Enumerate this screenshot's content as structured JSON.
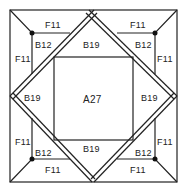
{
  "diagram": {
    "type": "quilt-block-pattern",
    "center_piece": {
      "label": "A27"
    },
    "side_pieces": [
      {
        "position": "top",
        "label": "B19"
      },
      {
        "position": "left",
        "label": "B19"
      },
      {
        "position": "right",
        "label": "B19"
      },
      {
        "position": "bottom",
        "label": "B19"
      }
    ],
    "corners": [
      {
        "position": "top-left",
        "small_square": "B12",
        "triangle_a": "F11",
        "triangle_b": "F11"
      },
      {
        "position": "top-right",
        "small_square": "B12",
        "triangle_a": "F11",
        "triangle_b": "F11"
      },
      {
        "position": "bottom-left",
        "small_square": "B12",
        "triangle_a": "F11",
        "triangle_b": "F11"
      },
      {
        "position": "bottom-right",
        "small_square": "B12",
        "triangle_a": "F11",
        "triangle_b": "F11"
      }
    ],
    "colors": {
      "line": "#222222",
      "background": "#ffffff"
    }
  }
}
